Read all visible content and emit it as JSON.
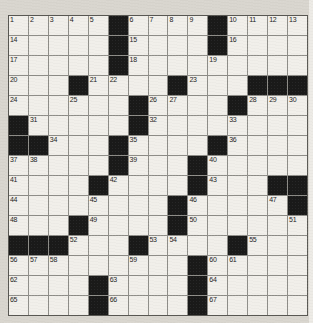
{
  "crossword": {
    "rows": 15,
    "cols": 15,
    "grid": [
      ".....#....#....",
      ".....#....#....",
      ".....#.........",
      "...#....#...###",
      "......#....#...",
      "#.....#........",
      "##...#....#....",
      ".....#...#.....",
      "....#....#...##",
      "........#.....#",
      "...#....#......",
      "###...#....#...",
      ".........#.....",
      "....#....#.....",
      "....#....#....."
    ],
    "numbers": [
      [
        1,
        1,
        1
      ],
      [
        2,
        1,
        2
      ],
      [
        3,
        1,
        3
      ],
      [
        4,
        1,
        4
      ],
      [
        5,
        1,
        5
      ],
      [
        6,
        1,
        7
      ],
      [
        7,
        1,
        8
      ],
      [
        8,
        1,
        9
      ],
      [
        9,
        1,
        10
      ],
      [
        10,
        1,
        12
      ],
      [
        11,
        1,
        13
      ],
      [
        12,
        1,
        14
      ],
      [
        13,
        1,
        15
      ],
      [
        14,
        2,
        1
      ],
      [
        15,
        2,
        7
      ],
      [
        16,
        2,
        12
      ],
      [
        17,
        3,
        1
      ],
      [
        18,
        3,
        7
      ],
      [
        19,
        3,
        11
      ],
      [
        20,
        4,
        1
      ],
      [
        21,
        4,
        5
      ],
      [
        22,
        4,
        6
      ],
      [
        23,
        4,
        10
      ],
      [
        24,
        5,
        1
      ],
      [
        25,
        5,
        4
      ],
      [
        26,
        5,
        8
      ],
      [
        27,
        5,
        9
      ],
      [
        28,
        5,
        13
      ],
      [
        29,
        5,
        14
      ],
      [
        30,
        5,
        15
      ],
      [
        31,
        6,
        2
      ],
      [
        32,
        6,
        8
      ],
      [
        33,
        6,
        12
      ],
      [
        34,
        7,
        3
      ],
      [
        35,
        7,
        7
      ],
      [
        36,
        7,
        12
      ],
      [
        37,
        8,
        1
      ],
      [
        38,
        8,
        2
      ],
      [
        39,
        8,
        7
      ],
      [
        40,
        8,
        11
      ],
      [
        41,
        9,
        1
      ],
      [
        42,
        9,
        6
      ],
      [
        43,
        9,
        11
      ],
      [
        44,
        10,
        1
      ],
      [
        45,
        10,
        5
      ],
      [
        46,
        10,
        10
      ],
      [
        47,
        10,
        14
      ],
      [
        48,
        11,
        1
      ],
      [
        49,
        11,
        5
      ],
      [
        50,
        11,
        10
      ],
      [
        51,
        11,
        15
      ],
      [
        52,
        12,
        4
      ],
      [
        53,
        12,
        8
      ],
      [
        54,
        12,
        9
      ],
      [
        55,
        12,
        13
      ],
      [
        56,
        13,
        1
      ],
      [
        57,
        13,
        2
      ],
      [
        58,
        13,
        3
      ],
      [
        59,
        13,
        7
      ],
      [
        60,
        13,
        11
      ],
      [
        61,
        13,
        12
      ],
      [
        62,
        14,
        1
      ],
      [
        63,
        14,
        6
      ],
      [
        64,
        14,
        11
      ],
      [
        65,
        15,
        1
      ],
      [
        66,
        15,
        6
      ],
      [
        67,
        15,
        11
      ]
    ],
    "colors": {
      "paper": "#d9d6cf",
      "cell": "#f1efea",
      "black_square": "#1a1a19",
      "grid_line": "#8e8d88",
      "grid_border": "#595853",
      "number": "#1d1d1c",
      "right_edge": "#edebe6"
    }
  }
}
